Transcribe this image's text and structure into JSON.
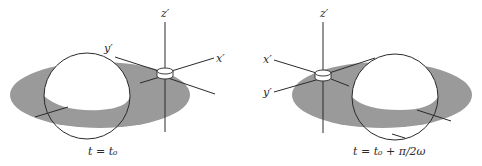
{
  "diagram": {
    "panels": [
      {
        "id": "left",
        "axes": {
          "z": "z′",
          "y": "y′",
          "x": "x′"
        },
        "caption": "t = t₀"
      },
      {
        "id": "right",
        "axes": {
          "z": "z′",
          "x": "x′",
          "y": "y′"
        },
        "caption": "t = t₀ + π/2ω"
      }
    ],
    "colors": {
      "shade": "#9a9a9a",
      "ink": "#2a2a2a",
      "background": "#ffffff"
    }
  }
}
